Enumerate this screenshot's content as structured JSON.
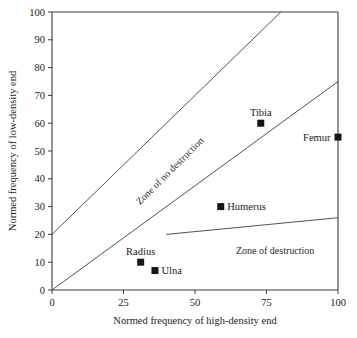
{
  "chart_data": {
    "type": "scatter",
    "title": "",
    "xlabel": "Normed frequency of high-density end",
    "ylabel": "Normed frequency of low-density end",
    "xlim": [
      0,
      100
    ],
    "ylim": [
      0,
      100
    ],
    "xticks": [
      0,
      25,
      50,
      75,
      100
    ],
    "yticks": [
      0,
      10,
      20,
      30,
      40,
      50,
      60,
      70,
      80,
      90,
      100
    ],
    "xtick_labels": [
      "0",
      "25",
      "50",
      "75",
      "100"
    ],
    "ytick_labels": [
      "0",
      "10",
      "20",
      "30",
      "40",
      "50",
      "60",
      "70",
      "80",
      "90",
      "100"
    ],
    "grid": false,
    "legend": "none",
    "marker_color": "#161616",
    "line_color": "#4a4a4a",
    "axis_color": "#3a3a3a",
    "points": [
      {
        "label": "Radius",
        "x": 31,
        "y": 10,
        "label_position": "above"
      },
      {
        "label": "Ulna",
        "x": 36,
        "y": 7,
        "label_position": "right"
      },
      {
        "label": "Humerus",
        "x": 59,
        "y": 30,
        "label_position": "right"
      },
      {
        "label": "Tibia",
        "x": 73,
        "y": 60,
        "label_position": "above"
      },
      {
        "label": "Femur",
        "x": 100,
        "y": 55,
        "label_position": "left"
      }
    ],
    "boundary_lines": [
      {
        "name": "upper-boundary",
        "points": [
          [
            0,
            20
          ],
          [
            80,
            100
          ]
        ]
      },
      {
        "name": "middle-boundary",
        "points": [
          [
            0,
            0
          ],
          [
            100,
            75
          ]
        ]
      },
      {
        "name": "lower-boundary",
        "points": [
          [
            40,
            20
          ],
          [
            100,
            26
          ]
        ]
      }
    ],
    "annotations": [
      {
        "name": "zone-of-no-destruction",
        "text": "Zone of no destruction",
        "x": 42,
        "y": 42,
        "rotation": -45
      },
      {
        "name": "zone-of-destruction",
        "text": "Zone of destruction",
        "x": 78,
        "y": 13,
        "rotation": 0
      }
    ]
  }
}
